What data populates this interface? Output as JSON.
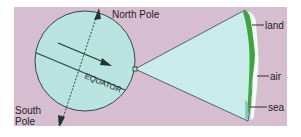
{
  "diagram": {
    "colors": {
      "background": "#d7bdd0",
      "globe_fill": "#b9e3de",
      "cone_fill": "#c9ecea",
      "outline": "#2f4a4a",
      "land_green": "#3fa33f",
      "air_white": "#f4faf8",
      "text": "#1e1e1e"
    },
    "labels": {
      "north_pole": "North Pole",
      "south_pole_line1": "South",
      "south_pole_line2": "Pole",
      "equator": "EQUATOR",
      "land": "land",
      "air": "air",
      "sea": "sea"
    }
  }
}
